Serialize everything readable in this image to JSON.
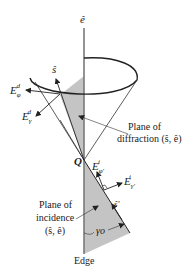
{
  "diagram": {
    "type": "edge-diffraction geometry (Keller cone)",
    "colors": {
      "line": "#333333",
      "shade": "#bfbfbf",
      "edge": "#777777",
      "background": "#ffffff"
    },
    "labels": {
      "e_hat": "ê",
      "s_hat": "ŝ",
      "s_prime_hat": "ŝ'",
      "E_phi_d": {
        "base": "E",
        "sub": "φ",
        "sup": "d"
      },
      "E_gamma_d": {
        "base": "E",
        "sub": "γ",
        "sup": "d"
      },
      "E_phi_i": {
        "base": "E",
        "sub": "φ'",
        "sup": "i"
      },
      "E_gamma_i": {
        "base": "E",
        "sub": "γ'",
        "sup": "i"
      },
      "Q": "Q",
      "gamma_o": "γo",
      "edge": "Edge",
      "plane_diffraction_line1": "Plane of",
      "plane_diffraction_line2": "diffraction (ŝ, ê)",
      "plane_incidence_line1": "Plane of",
      "plane_incidence_line2": "incidence",
      "plane_incidence_line3": "(ŝ, ê)"
    }
  }
}
